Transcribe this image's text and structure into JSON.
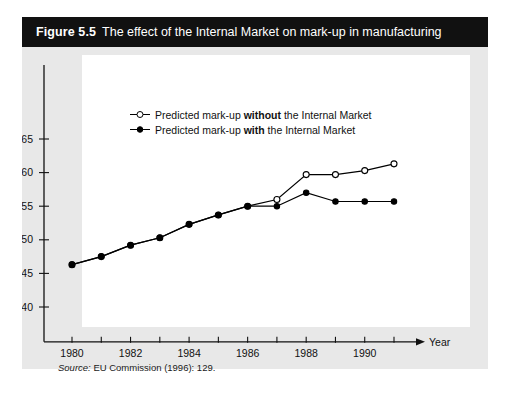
{
  "figure": {
    "number_label": "Figure 5.5",
    "title": "The effect of the Internal Market on mark-up in manufacturing",
    "source_word": "Source:",
    "source_text": "EU Commission (1996): 129.",
    "title_bar_color": "#111111",
    "panel_color": "#e8e8e8",
    "plot_bg_color": "#ffffff"
  },
  "legend": {
    "position": "top-left-inside",
    "entries": [
      {
        "marker": "open-circle",
        "prefix": "Predicted mark-up ",
        "emphasis": "without",
        "suffix": " the Internal Market",
        "full": "Predicted mark-up without the Internal Market"
      },
      {
        "marker": "filled-circle",
        "prefix": "Predicted mark-up ",
        "emphasis": "with",
        "suffix": " the Internal Market",
        "full": "Predicted mark-up with the Internal Market"
      }
    ]
  },
  "chart_data": {
    "type": "line",
    "title": "The effect of the Internal Market on mark-up in manufacturing",
    "xlabel": "Year",
    "ylabel": "",
    "x": [
      1980,
      1981,
      1982,
      1983,
      1984,
      1985,
      1986,
      1987,
      1988,
      1989,
      1990,
      1991
    ],
    "xtick_values": [
      1980,
      1981,
      1982,
      1983,
      1984,
      1985,
      1986,
      1987,
      1988,
      1989,
      1990,
      1991
    ],
    "xtick_labels": [
      "1980",
      "",
      "1982",
      "",
      "1984",
      "",
      "1986",
      "",
      "1988",
      "",
      "1990",
      ""
    ],
    "xlim": [
      1979.3,
      1991.6
    ],
    "ytick_values": [
      0.14,
      0.145,
      0.15,
      0.155,
      0.16,
      0.165
    ],
    "ytick_labels": [
      "0.140",
      "0.145",
      "0.150",
      "0.155",
      "0.160",
      "0.165"
    ],
    "ylim": [
      0.1375,
      0.1665
    ],
    "grid": false,
    "axis_arrow_x": true,
    "series": [
      {
        "name": "Predicted mark-up without the Internal Market",
        "marker": "open-circle",
        "color": "#000000",
        "values": [
          0.1463,
          0.1475,
          0.1492,
          0.1503,
          0.1523,
          0.1537,
          0.155,
          0.156,
          0.1597,
          0.1597,
          0.1603,
          0.1613
        ]
      },
      {
        "name": "Predicted mark-up with the Internal Market",
        "marker": "filled-circle",
        "color": "#000000",
        "values": [
          0.1463,
          0.1475,
          0.1492,
          0.1503,
          0.1523,
          0.1537,
          0.155,
          0.155,
          0.157,
          0.1557,
          0.1557,
          0.1557
        ]
      }
    ]
  }
}
